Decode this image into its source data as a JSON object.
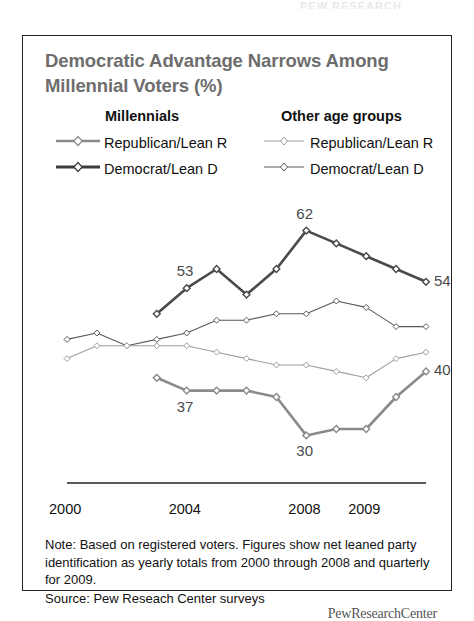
{
  "page": {
    "top_remnant_text": "PEW RESEARCH"
  },
  "figure": {
    "title": "Democratic Advantage Narrows Among Millennial Voters (%)",
    "note": "Note: Based on registered voters. Figures show net leaned party identification as yearly totals from 2000 through 2008 and quarterly for 2009.",
    "source": "Source: Pew Reseach Center surveys",
    "logo": "PewResearchCenter"
  },
  "legend": {
    "group_millennials": "Millennials",
    "group_other": "Other age groups",
    "millennials_republican": "Republican/Lean R",
    "millennials_democrat": "Democrat/Lean D",
    "other_republican": "Republican/Lean R",
    "other_democrat": "Democrat/Lean D"
  },
  "axis": {
    "ticks": [
      "2000",
      "2004",
      "2008",
      "2009"
    ]
  },
  "chart_data": {
    "type": "line",
    "title": "Democratic Advantage Narrows Among Millennial Voters (%)",
    "xlabel": "",
    "ylabel": "",
    "ylim": [
      26,
      66
    ],
    "grid": false,
    "legend_position": "top",
    "x": [
      "2000",
      "2001",
      "2002",
      "2003",
      "2004",
      "2005",
      "2006",
      "2007",
      "2008",
      "2009 Q1",
      "2009 Q2",
      "2009 Q3",
      "2009 Q4"
    ],
    "series": [
      {
        "name": "Millennials Democrat/Lean D",
        "group": "Millennials",
        "party": "Democrat/Lean D",
        "color": "#4a4a4a",
        "width": 2.6,
        "x": [
          "2003",
          "2004",
          "2005",
          "2006",
          "2007",
          "2008",
          "2009 Q1",
          "2009 Q2",
          "2009 Q3",
          "2009 Q4"
        ],
        "values": [
          49,
          53,
          56,
          52,
          56,
          62,
          60,
          58,
          56,
          54
        ],
        "labels": [
          {
            "x": "2004",
            "value": 53,
            "text": "53"
          },
          {
            "x": "2008",
            "value": 62,
            "text": "62"
          },
          {
            "x": "2009 Q4",
            "value": 54,
            "text": "54"
          }
        ]
      },
      {
        "name": "Millennials Republican/Lean R",
        "group": "Millennials",
        "party": "Republican/Lean R",
        "color": "#8a8a8a",
        "width": 2.6,
        "x": [
          "2003",
          "2004",
          "2005",
          "2006",
          "2007",
          "2008",
          "2009 Q1",
          "2009 Q2",
          "2009 Q3",
          "2009 Q4"
        ],
        "values": [
          39,
          37,
          37,
          37,
          36,
          30,
          31,
          31,
          36,
          40
        ],
        "labels": [
          {
            "x": "2004",
            "value": 37,
            "text": "37"
          },
          {
            "x": "2008",
            "value": 30,
            "text": "30"
          },
          {
            "x": "2009 Q4",
            "value": 40,
            "text": "40"
          }
        ]
      },
      {
        "name": "Other age groups Democrat/Lean D",
        "group": "Other age groups",
        "party": "Democrat/Lean D",
        "color": "#5a5a5a",
        "width": 1.1,
        "x": [
          "2000",
          "2001",
          "2002",
          "2003",
          "2004",
          "2005",
          "2006",
          "2007",
          "2008",
          "2009 Q1",
          "2009 Q2",
          "2009 Q3",
          "2009 Q4"
        ],
        "values": [
          45,
          46,
          44,
          45,
          46,
          48,
          48,
          49,
          49,
          51,
          50,
          47,
          47
        ],
        "labels": []
      },
      {
        "name": "Other age groups Republican/Lean R",
        "group": "Other age groups",
        "party": "Republican/Lean R",
        "color": "#9d9d9d",
        "width": 1.1,
        "x": [
          "2000",
          "2001",
          "2002",
          "2003",
          "2004",
          "2005",
          "2006",
          "2007",
          "2008",
          "2009 Q1",
          "2009 Q2",
          "2009 Q3",
          "2009 Q4"
        ],
        "values": [
          42,
          44,
          44,
          44,
          44,
          43,
          42,
          41,
          41,
          40,
          39,
          42,
          43
        ],
        "labels": []
      }
    ]
  }
}
